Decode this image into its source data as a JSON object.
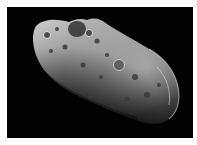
{
  "image": {
    "subject": "asteroid",
    "alt": "Grayscale photograph of an elongated, cratered asteroid against a black space background",
    "colors": {
      "border": "#fdfdfd",
      "background": "#020202",
      "highlight": "#d8d8d8",
      "midtone": "#7a7a7a",
      "shadow": "#1a1a1a"
    }
  }
}
